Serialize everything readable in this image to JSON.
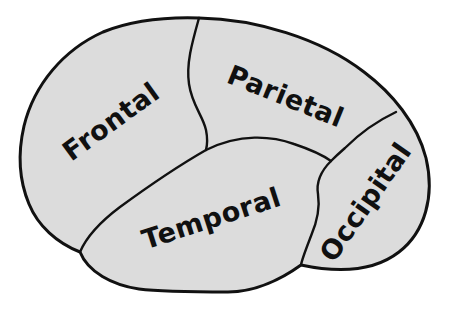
{
  "diagram": {
    "background_color": "#ffffff",
    "fill_color": "#dcdcdc",
    "stroke_color": "#111111",
    "label_color": "#101010",
    "outline_width": 3,
    "sulcus_width": 2.4
  },
  "lobes": [
    {
      "id": "frontal",
      "label": "Frontal",
      "font_size": 27,
      "rotation": -36,
      "x": 112,
      "y": 123
    },
    {
      "id": "parietal",
      "label": "Parietal",
      "font_size": 27,
      "rotation": 22,
      "x": 285,
      "y": 98
    },
    {
      "id": "temporal",
      "label": "Temporal",
      "font_size": 27,
      "rotation": -18,
      "x": 212,
      "y": 220
    },
    {
      "id": "occipital",
      "label": "Occipital",
      "font_size": 27,
      "rotation": -55,
      "x": 367,
      "y": 203
    }
  ]
}
